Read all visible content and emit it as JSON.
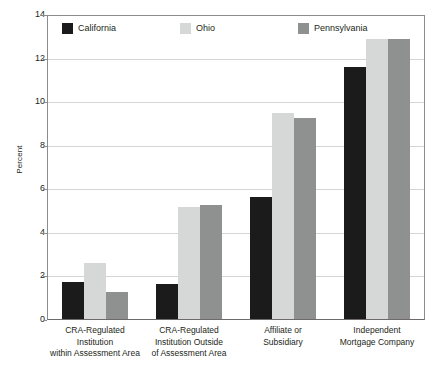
{
  "chart_data": {
    "type": "bar",
    "title": "",
    "xlabel": "",
    "ylabel": "Percent",
    "ylim": [
      0,
      14
    ],
    "yticks": [
      0,
      2,
      4,
      6,
      8,
      10,
      12,
      14
    ],
    "ytick_labels": [
      "0",
      "2",
      "4",
      "6",
      "8",
      "10",
      "12",
      "14"
    ],
    "grid": true,
    "legend_position": "top-left-inside",
    "categories": [
      "CRA-Regulated Institution within Assessment Area",
      "CRA-Regulated Institution Outside of Assessment Area",
      "Affiliate or Subsidiary",
      "Independent Mortgage Company"
    ],
    "category_lines": [
      [
        "CRA-Regulated",
        "Institution",
        "within Assessment Area"
      ],
      [
        "CRA-Regulated",
        "Institution Outside",
        "of Assessment Area"
      ],
      [
        "Affiliate or",
        "Subsidiary"
      ],
      [
        "Independent",
        "Mortgage Company"
      ]
    ],
    "series": [
      {
        "name": "California",
        "color": "#1b1b1b",
        "values": [
          1.75,
          1.65,
          5.65,
          11.6
        ]
      },
      {
        "name": "Ohio",
        "color": "#d6d7d7",
        "values": [
          2.6,
          5.2,
          9.5,
          12.9
        ]
      },
      {
        "name": "Pennsylvania",
        "color": "#8f9090",
        "values": [
          1.3,
          5.3,
          9.25,
          12.9
        ]
      }
    ]
  },
  "axis": {
    "y_title": "Percent"
  },
  "colors": {
    "california": "#1b1b1b",
    "ohio": "#d6d7d7",
    "pennsylvania": "#8f9090",
    "gridline": "#d5d5d5",
    "frame": "#8c8c8c",
    "text": "#231f20",
    "background": "#ffffff"
  }
}
